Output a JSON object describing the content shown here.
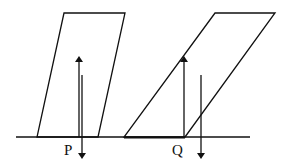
{
  "diagram": {
    "labels": {
      "p": "P",
      "q": "Q"
    },
    "colors": {
      "stroke": "#111111",
      "background": "#ffffff"
    },
    "ground": {
      "x1": 16,
      "x2": 250,
      "y": 137
    },
    "blocks": [
      {
        "name": "left-parallelogram",
        "points": "64,13 125,13 98,137 37,137"
      },
      {
        "name": "right-parallelogram",
        "points": "215,13 275,13 185,137 124,137"
      }
    ],
    "arrows": [
      {
        "name": "p-up-arrow",
        "x": 79,
        "y_from": 137,
        "y_to": 57,
        "direction": "up"
      },
      {
        "name": "p-down-arrow",
        "x": 82,
        "y_from": 75,
        "y_to": 158,
        "direction": "down"
      },
      {
        "name": "q-up-arrow",
        "x": 184,
        "y_from": 137,
        "y_to": 57,
        "direction": "up"
      },
      {
        "name": "q-down-arrow",
        "x": 201,
        "y_from": 75,
        "y_to": 158,
        "direction": "down"
      }
    ]
  }
}
